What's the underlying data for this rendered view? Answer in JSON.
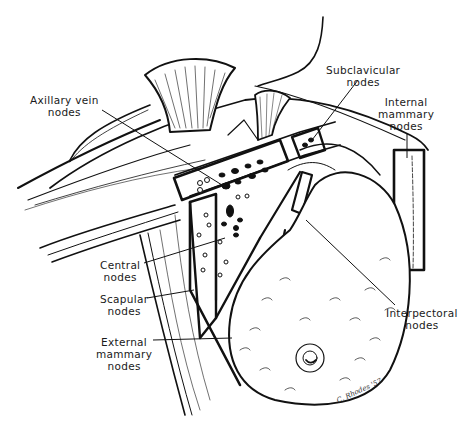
{
  "figure": {
    "colors": {
      "ink": "#111111",
      "paper": "#ffffff"
    },
    "labels": {
      "axillary_vein": {
        "line1": "Axillary vein",
        "line2": "nodes"
      },
      "subclavicular": {
        "line1": "Subclavicular",
        "line2": "nodes"
      },
      "internal_mammary": {
        "line1": "Internal",
        "line2": "mammary",
        "line3": "nodes"
      },
      "central": {
        "line1": "Central",
        "line2": "nodes"
      },
      "scapular": {
        "line1": "Scapular",
        "line2": "nodes"
      },
      "external_mammary": {
        "line1": "External",
        "line2": "mammary",
        "line3": "nodes"
      },
      "interpectoral": {
        "line1": "Interpectoral",
        "line2": "nodes"
      }
    },
    "signature": "C. Rhodes '57"
  }
}
